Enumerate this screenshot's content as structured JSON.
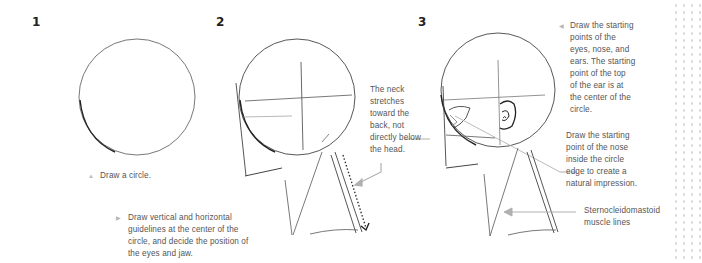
{
  "steps": [
    {
      "number": "1",
      "caption_bullet": "▲",
      "caption": "Draw a circle."
    },
    {
      "number": "2",
      "caption_bullet": "▶",
      "caption_lines": [
        "Draw vertical and horizontal",
        "guidelines at the center of the",
        "circle, and decide the position of",
        "the eyes and jaw."
      ],
      "callout_lines": [
        "The neck",
        "stretches",
        "toward the",
        "back, not",
        "directly below",
        "the head."
      ]
    },
    {
      "number": "3",
      "caption_bullet": "◀",
      "notes": [
        {
          "lines": [
            "Draw the starting",
            "points of the",
            "eyes, nose, and",
            "ears. The starting",
            "point of the top",
            "of the ear is at",
            "the center of the",
            "circle."
          ]
        },
        {
          "lines": [
            "Draw the starting",
            "point of the nose",
            "inside the circle",
            "edge to create a",
            "natural impression."
          ]
        },
        {
          "lines": [
            "Sternocleidomastoid",
            "muscle lines"
          ]
        }
      ]
    }
  ],
  "colors": {
    "stroke": "#3a3a3a",
    "guide": "#9a9a9a",
    "arrow": "#b0b0b0",
    "text": "#555555",
    "dots": "#d6d6d6"
  }
}
